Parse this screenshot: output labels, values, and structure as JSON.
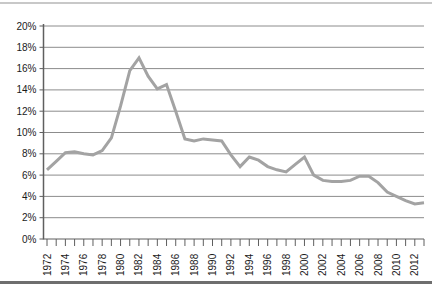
{
  "page": {
    "background": "#ffffff",
    "top_rule_color": "#c8c8c8",
    "bottom_rule_color": "#6e6e6e"
  },
  "chart_data": {
    "type": "line",
    "title": "",
    "xlabel": "",
    "ylabel": "",
    "x": [
      1972,
      1973,
      1974,
      1975,
      1976,
      1977,
      1978,
      1979,
      1980,
      1981,
      1982,
      1983,
      1984,
      1985,
      1986,
      1987,
      1988,
      1989,
      1990,
      1991,
      1992,
      1993,
      1994,
      1995,
      1996,
      1997,
      1998,
      1999,
      2000,
      2001,
      2002,
      2003,
      2004,
      2005,
      2006,
      2007,
      2008,
      2009,
      2010,
      2011,
      2012,
      2013
    ],
    "series": [
      {
        "name": "rate-percent",
        "values": [
          6.5,
          7.3,
          8.1,
          8.2,
          8.0,
          7.9,
          8.3,
          9.5,
          12.5,
          15.8,
          17.0,
          15.3,
          14.1,
          14.5,
          12.0,
          9.4,
          9.2,
          9.4,
          9.3,
          9.2,
          7.9,
          6.8,
          7.7,
          7.4,
          6.8,
          6.5,
          6.3,
          7.0,
          7.7,
          6.0,
          5.5,
          5.4,
          5.4,
          5.5,
          5.9,
          5.9,
          5.3,
          4.4,
          4.0,
          3.6,
          3.3,
          3.4
        ]
      }
    ],
    "ylim": [
      0,
      20
    ],
    "y_tick_step": 2,
    "y_tick_labels": [
      "0%",
      "2%",
      "4%",
      "6%",
      "8%",
      "10%",
      "12%",
      "14%",
      "16%",
      "18%",
      "20%"
    ],
    "x_tick_label_interval": 2,
    "x_tick_labels": [
      "1972",
      "1974",
      "1976",
      "1978",
      "1980",
      "1982",
      "1984",
      "1986",
      "1988",
      "1990",
      "1992",
      "1994",
      "1996",
      "1998",
      "2000",
      "2002",
      "2004",
      "2006",
      "2008",
      "2010",
      "2012"
    ],
    "grid": "horizontal",
    "legend": "none",
    "line_color": "#a3a3a3",
    "line_width": 3,
    "grid_color": "#8c8c8c",
    "axis_color": "#5f5f5f",
    "label_color": "#1a1a1a",
    "label_font_size": 10
  }
}
